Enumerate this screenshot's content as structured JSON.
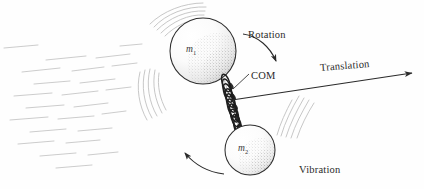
{
  "figure": {
    "background_color": "#fefefe",
    "ink_color": "#2a2a2a",
    "motion_line_color": "#c9c9c9"
  },
  "labels": {
    "rotation": "Rotation",
    "translation": "Translation",
    "com": "COM",
    "vibration": "Vibration",
    "mass1": "m",
    "mass1_sub": "1",
    "mass2": "m",
    "mass2_sub": "2"
  },
  "elements": {
    "sphere_large": {
      "name": "mass-1-sphere",
      "cx": 203,
      "cy": 51,
      "r": 33
    },
    "sphere_small": {
      "name": "mass-2-sphere",
      "cx": 250,
      "cy": 150,
      "r": 25
    },
    "spring": {
      "name": "connecting-spring",
      "from_x": 224,
      "from_y": 79,
      "to_x": 240,
      "to_y": 131,
      "coils": 11
    },
    "translation_arrow": {
      "name": "translation-arrow",
      "from_x": 232,
      "from_y": 100,
      "to_x": 414,
      "to_y": 73
    },
    "rotation_arc_top": {
      "name": "rotation-arc-top",
      "from_x": 243,
      "from_y": 34,
      "to_x": 276,
      "to_y": 62
    },
    "rotation_arc_bottom": {
      "name": "rotation-arc-bottom",
      "from_x": 222,
      "from_y": 173,
      "to_x": 183,
      "to_y": 152
    }
  }
}
